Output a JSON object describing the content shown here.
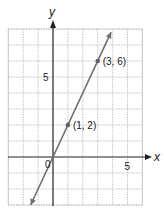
{
  "chart_data": {
    "type": "line",
    "title": "",
    "xlabel": "x",
    "ylabel": "y",
    "xlim": [
      -3,
      6
    ],
    "ylim": [
      -3,
      8
    ],
    "grid": true,
    "x_tick_labels": [
      {
        "value": 5,
        "label": "5"
      }
    ],
    "y_tick_labels": [
      {
        "value": 5,
        "label": "5"
      }
    ],
    "origin_label": "0",
    "series": [
      {
        "name": "y = 2x",
        "equation": "y = 2x",
        "x": [
          -1.5,
          3.9
        ],
        "y": [
          -3,
          7.8
        ],
        "arrows": "both",
        "color": "#707070"
      }
    ],
    "points": [
      {
        "x": 1,
        "y": 2,
        "label": "(1, 2)"
      },
      {
        "x": 3,
        "y": 6,
        "label": "(3, 6)"
      }
    ]
  },
  "colors": {
    "grid": "#b8b8b8",
    "axis": "#222222",
    "line": "#707070",
    "point": "#606060",
    "text": "#222222"
  }
}
